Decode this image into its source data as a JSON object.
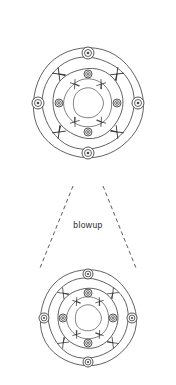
{
  "page": {
    "width": 176,
    "height": 385,
    "background_color": "#ffffff",
    "line_color": "#3a3a3a",
    "hatch_color": "#2b2b2b",
    "dash_color": "#33333a"
  },
  "top_cut_text": {
    "value": "cut off header text",
    "note": "clipped at top edge, illegible"
  },
  "labels": {
    "blowup": "blowup"
  },
  "chart_data": {
    "type": "diagram",
    "title": "blowup",
    "views": [
      {
        "name": "main-view",
        "center": [
          88,
          103
        ],
        "rings": [
          55,
          46,
          35,
          24,
          15
        ],
        "bolts_outer": {
          "count": 4,
          "radius": 50,
          "size": 6,
          "angles_deg": [
            270,
            0,
            90,
            180
          ]
        },
        "bolts_inner": {
          "count": 4,
          "radius": 29,
          "size": 4,
          "angles_deg": [
            270,
            0,
            90,
            180
          ]
        },
        "hatches_outer": {
          "count": 4,
          "radius": 41,
          "angles_deg": [
            225,
            315,
            45,
            135
          ]
        },
        "hatches_inner": {
          "count": 4,
          "radius": 23,
          "angles_deg": [
            235,
            305,
            55,
            125
          ]
        }
      },
      {
        "name": "blowup-view",
        "center": [
          88,
          318
        ],
        "rings": [
          48,
          40,
          30,
          21,
          13
        ],
        "bolts_outer": {
          "count": 4,
          "radius": 44,
          "size": 5,
          "angles_deg": [
            270,
            0,
            90,
            180
          ]
        },
        "bolts_inner": {
          "count": 4,
          "radius": 25,
          "size": 4,
          "angles_deg": [
            270,
            0,
            90,
            180
          ]
        },
        "hatches_outer": {
          "count": 4,
          "radius": 35,
          "angles_deg": [
            225,
            315,
            45,
            135
          ]
        },
        "hatches_inner": {
          "count": 4,
          "radius": 20,
          "angles_deg": [
            235,
            305,
            55,
            125
          ]
        }
      }
    ],
    "leaders": [
      {
        "from": [
          73,
          186
        ],
        "to": [
          40,
          268
        ]
      },
      {
        "from": [
          103,
          186
        ],
        "to": [
          136,
          268
        ]
      }
    ]
  }
}
